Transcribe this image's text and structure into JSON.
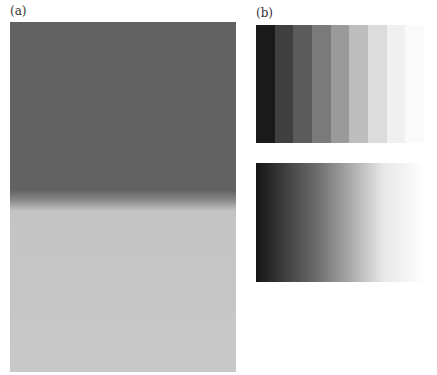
{
  "panels": {
    "a": {
      "label": "(a)",
      "top_color": "#626262",
      "bottom_color": "#c8c8c8"
    },
    "b": {
      "label": "(b)",
      "stripes": [
        "#1a1a1a",
        "#404040",
        "#5c5c5c",
        "#7a7a7a",
        "#9a9a9a",
        "#bdbdbd",
        "#dcdcdc",
        "#f0f0f0",
        "#fafafa"
      ],
      "gradient": {
        "from": "#141414",
        "to": "#ffffff"
      }
    }
  }
}
